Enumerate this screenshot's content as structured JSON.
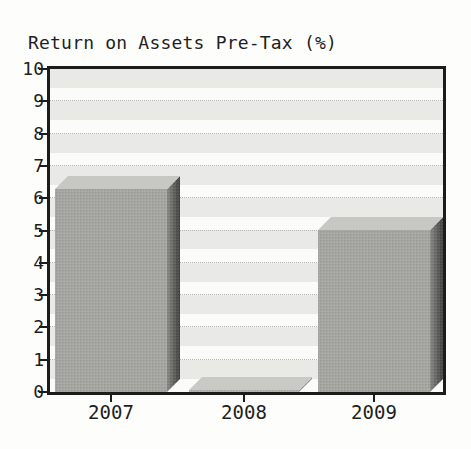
{
  "chart_data": {
    "type": "bar",
    "title": "Return on Assets Pre-Tax (%)",
    "categories": [
      "2007",
      "2008",
      "2009"
    ],
    "values": [
      6.3,
      0.0,
      5.0
    ],
    "ylim": [
      0,
      10
    ],
    "ytick_step": 1,
    "xlabel": "",
    "ylabel": "",
    "grid": true,
    "legend": false,
    "style": "3d-block-bars-grayscale"
  },
  "colors": {
    "background": "#fdfdfc",
    "plot_border": "#1c1c1a",
    "band_gray": "#e9e9e6",
    "band_white": "#fbfbf9",
    "gridline": "#b4b4b1",
    "bar_front": "#a5a5a2",
    "bar_top": "#c7c7c4",
    "bar_side_light": "#8a8a87",
    "bar_side_dark": "#4e4e4b",
    "flat_bar_top": "#c9c9c6",
    "flat_bar_front": "#b3b3b0",
    "flat_bar_side": "#9a9a97",
    "text": "#1f1f1d"
  }
}
